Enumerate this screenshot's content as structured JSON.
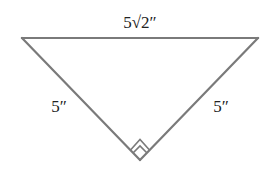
{
  "diagram": {
    "type": "right-isosceles-triangle",
    "stroke_color": "#7a7a7a",
    "text_color": "#222222",
    "vertices": {
      "top_left": [
        22,
        38
      ],
      "top_right": [
        258,
        38
      ],
      "bottom": [
        140,
        160
      ]
    },
    "right_angle_at": "bottom",
    "labels": {
      "hypotenuse": "5√2″",
      "left_leg": "5″",
      "right_leg": "5″"
    }
  }
}
